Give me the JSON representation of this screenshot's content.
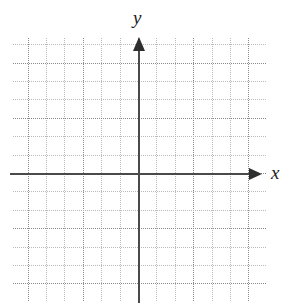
{
  "figure": {
    "kind": "coordinate-plane",
    "title": "",
    "background_color": "#ffffff"
  },
  "axes": {
    "x": {
      "label": "x",
      "arrow": "right",
      "color": "#4a4a4a"
    },
    "y": {
      "label": "y",
      "arrow": "up",
      "color": "#4a4a4a"
    },
    "origin": {
      "x": 138,
      "y": 173
    }
  },
  "chart_data": {
    "type": "scatter",
    "title": "",
    "xlabel": "x",
    "ylabel": "y",
    "series": [],
    "x": [],
    "values": [],
    "grid": true,
    "grid_style": "dotted",
    "grid_minor_color": "#b9b9b9",
    "grid_major_color": "#8a8a8a",
    "grid_spacing_px": 18.4,
    "grid_major_every": 3,
    "xlim": [
      -7,
      7
    ],
    "ylim": [
      -7,
      7
    ],
    "xticks": [],
    "yticks": [],
    "legend": "none",
    "annotations": []
  }
}
